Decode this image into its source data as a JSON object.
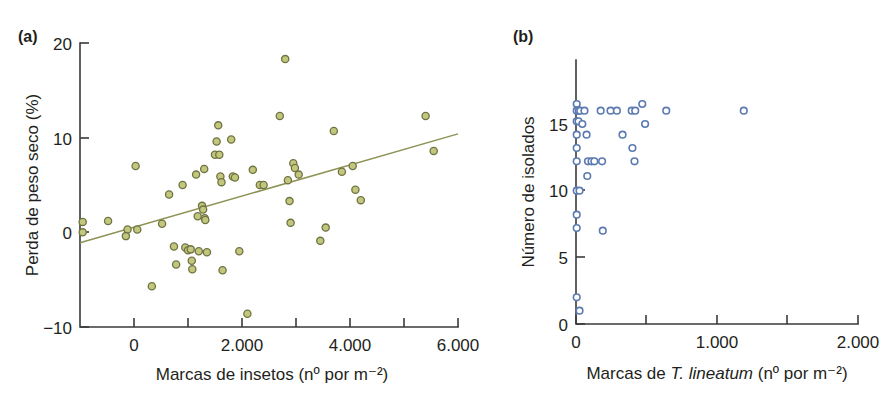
{
  "figure": {
    "width": 893,
    "height": 396,
    "background": "#ffffff"
  },
  "panels": {
    "a": {
      "tag": "(a)",
      "colors": {
        "marker_fill": "#c3c77e",
        "marker_stroke": "#6f7342",
        "line": "#8d9254"
      }
    },
    "b": {
      "tag": "(b)",
      "colors": {
        "marker_fill": "#ffffff",
        "marker_stroke": "#5b7bb0"
      }
    }
  },
  "chart_data": [
    {
      "panel": "(a)",
      "type": "scatter",
      "title": "",
      "xlabel": "Marcas de insetos (nº por m⁻²)",
      "ylabel": "Perda de peso seco (%)",
      "xlim": [
        -1000,
        6000
      ],
      "ylim": [
        -10,
        20
      ],
      "xticks": [
        0,
        1000,
        2000,
        3000,
        4000,
        5000,
        6000
      ],
      "xticklabels": [
        "0",
        "",
        "2.000",
        "",
        "4.000",
        "",
        "6.000"
      ],
      "yticks": [
        -10,
        0,
        10,
        20
      ],
      "yticklabels": [
        "−10",
        "0",
        "10",
        "20"
      ],
      "grid": false,
      "legend": "none",
      "trendline": {
        "x": [
          -1000,
          6000
        ],
        "y": [
          -1.1,
          10.4
        ]
      },
      "points": [
        [
          -950,
          1.1
        ],
        [
          -950,
          0.0
        ],
        [
          -480,
          1.2
        ],
        [
          -120,
          0.3
        ],
        [
          -150,
          -0.4
        ],
        [
          30,
          7.0
        ],
        [
          60,
          0.3
        ],
        [
          330,
          -5.7
        ],
        [
          520,
          0.9
        ],
        [
          650,
          4.0
        ],
        [
          740,
          -1.5
        ],
        [
          780,
          -3.4
        ],
        [
          900,
          5.0
        ],
        [
          950,
          -1.6
        ],
        [
          1000,
          -1.9
        ],
        [
          1050,
          -1.8
        ],
        [
          1070,
          -3.0
        ],
        [
          1080,
          -3.9
        ],
        [
          1150,
          6.1
        ],
        [
          1180,
          1.7
        ],
        [
          1200,
          -2.0
        ],
        [
          1260,
          2.8
        ],
        [
          1280,
          2.4
        ],
        [
          1300,
          6.7
        ],
        [
          1310,
          1.5
        ],
        [
          1320,
          1.3
        ],
        [
          1350,
          -2.1
        ],
        [
          1500,
          8.2
        ],
        [
          1530,
          9.6
        ],
        [
          1560,
          11.3
        ],
        [
          1580,
          8.2
        ],
        [
          1600,
          5.9
        ],
        [
          1620,
          5.3
        ],
        [
          1640,
          -4.0
        ],
        [
          1800,
          9.8
        ],
        [
          1830,
          5.9
        ],
        [
          1870,
          5.8
        ],
        [
          1950,
          -2.0
        ],
        [
          2100,
          -8.6
        ],
        [
          2200,
          6.6
        ],
        [
          2330,
          5.0
        ],
        [
          2400,
          5.0
        ],
        [
          2700,
          12.3
        ],
        [
          2800,
          18.3
        ],
        [
          2850,
          5.5
        ],
        [
          2880,
          3.3
        ],
        [
          2900,
          1.0
        ],
        [
          2950,
          7.3
        ],
        [
          2980,
          6.8
        ],
        [
          3050,
          6.1
        ],
        [
          3450,
          -0.9
        ],
        [
          3550,
          0.5
        ],
        [
          3700,
          10.7
        ],
        [
          3850,
          6.4
        ],
        [
          4050,
          7.0
        ],
        [
          4100,
          4.5
        ],
        [
          4200,
          3.4
        ],
        [
          5400,
          12.3
        ],
        [
          5550,
          8.6
        ]
      ]
    },
    {
      "panel": "(b)",
      "type": "scatter",
      "title": "",
      "xlabel": "Marcas de T. lineatum (nº por m⁻²)",
      "ylabel": "Número de isolados",
      "xlim": [
        0,
        2000
      ],
      "ylim": [
        0,
        18
      ],
      "xticks": [
        0,
        500,
        1000,
        1500,
        2000
      ],
      "xticklabels": [
        "0",
        "",
        "1.000",
        "",
        "2.000"
      ],
      "yticks": [
        0,
        5,
        10,
        15
      ],
      "yticklabels": [
        "0",
        "5",
        "10",
        "15"
      ],
      "grid": false,
      "legend": "none",
      "points": [
        [
          5,
          16.5
        ],
        [
          5,
          16.0
        ],
        [
          20,
          16.0
        ],
        [
          30,
          16.0
        ],
        [
          5,
          15.2
        ],
        [
          18,
          15.2
        ],
        [
          45,
          15.0
        ],
        [
          5,
          14.2
        ],
        [
          5,
          13.2
        ],
        [
          5,
          12.2
        ],
        [
          5,
          10.0
        ],
        [
          25,
          10.0
        ],
        [
          5,
          8.2
        ],
        [
          5,
          7.2
        ],
        [
          5,
          2.0
        ],
        [
          25,
          1.0
        ],
        [
          60,
          16.0
        ],
        [
          75,
          14.2
        ],
        [
          80,
          11.1
        ],
        [
          85,
          12.2
        ],
        [
          110,
          12.2
        ],
        [
          130,
          12.2
        ],
        [
          175,
          16.0
        ],
        [
          185,
          12.2
        ],
        [
          190,
          7.0
        ],
        [
          245,
          16.0
        ],
        [
          290,
          16.0
        ],
        [
          330,
          14.2
        ],
        [
          395,
          16.0
        ],
        [
          420,
          16.0
        ],
        [
          400,
          13.2
        ],
        [
          415,
          12.2
        ],
        [
          470,
          16.5
        ],
        [
          490,
          15.0
        ],
        [
          640,
          16.0
        ],
        [
          1190,
          16.0
        ]
      ]
    }
  ],
  "axis_titles": {
    "a_x": "Marcas de insetos (nº por m⁻²)",
    "a_y": "Perda de peso seco (%)",
    "b_x_prefix": "Marcas de ",
    "b_x_italic": "T. lineatum",
    "b_x_suffix": " (nº por m⁻²)",
    "b_y": "Número de isolados"
  }
}
